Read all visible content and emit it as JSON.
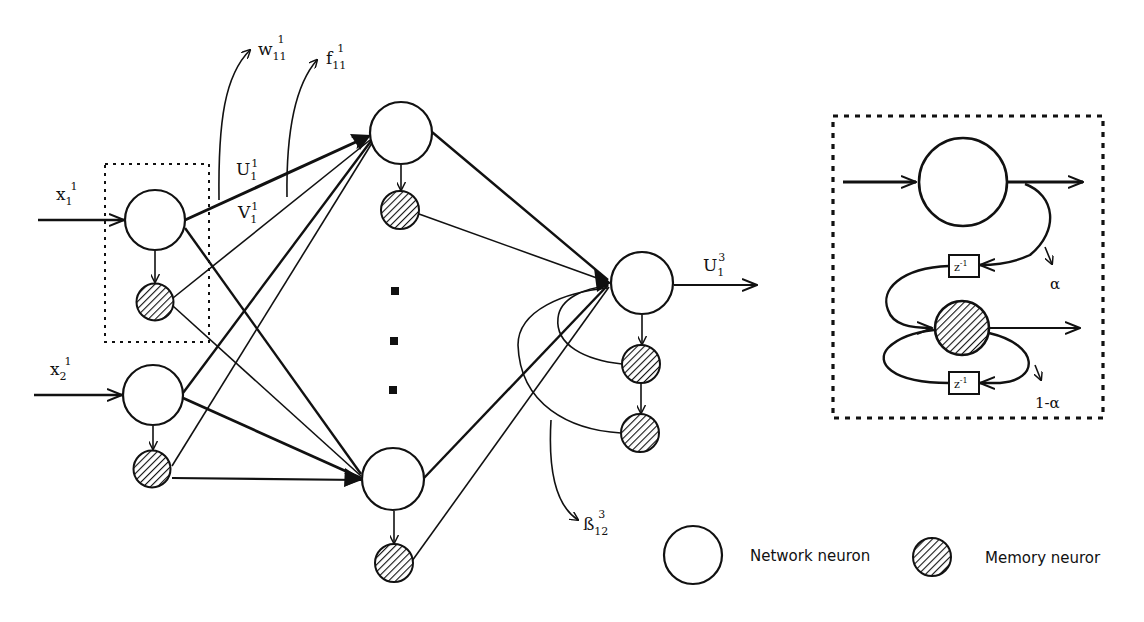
{
  "figure": {
    "type": "memory neuron network diagram",
    "colors": {
      "ink": "#111111",
      "background": "#ffffff"
    }
  },
  "inputs": [
    {
      "name": "x",
      "sub": "1",
      "sup": "1"
    },
    {
      "name": "x",
      "sub": "2",
      "sup": "1"
    }
  ],
  "weight_labels": {
    "w": {
      "name": "w",
      "sub": "11",
      "sup": "1"
    },
    "f": {
      "name": "f",
      "sub": "11",
      "sup": "1"
    },
    "U_in": {
      "name": "U",
      "sub": "1",
      "sup": "1"
    },
    "V_in": {
      "name": "V",
      "sub": "1",
      "sup": "1"
    },
    "beta": {
      "name": "ß",
      "sub": "12",
      "sup": "3"
    }
  },
  "output": {
    "name": "U",
    "sub": "1",
    "sup": "3"
  },
  "inset": {
    "delay_top": {
      "name": "z",
      "sup": "-1"
    },
    "delay_bottom": {
      "name": "z",
      "sup": "-1"
    },
    "alpha": "α",
    "one_minus_alpha": "1-α"
  },
  "legend": {
    "network_neuron": "Network neuron",
    "memory_neuron": "Memory neuror"
  },
  "layers": {
    "input_count": 2,
    "hidden_visible": 2,
    "hidden_ellipsis_dots": 3,
    "output_count": 1,
    "output_memory_chain": 2
  }
}
